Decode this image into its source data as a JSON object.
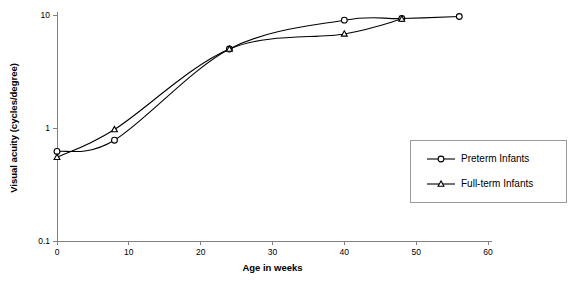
{
  "chart_data": {
    "type": "line",
    "title": "",
    "xlabel": "Age in weeks",
    "ylabel": "Visual acuity (cycles/degree)",
    "xlim": [
      0,
      60
    ],
    "ylim": [
      0.1,
      10
    ],
    "yscale": "log",
    "grid": false,
    "legend_position": "right-middle",
    "x_ticks": [
      "0",
      "10",
      "20",
      "30",
      "40",
      "50",
      "60"
    ],
    "x_tick_values": [
      0,
      10,
      20,
      30,
      40,
      50,
      60
    ],
    "y_ticks": [
      "0.1",
      "1",
      "10"
    ],
    "y_tick_values": [
      0.1,
      1,
      10
    ],
    "series": [
      {
        "name": "Preterm Infants",
        "marker": "circle",
        "color": "#000000",
        "x": [
          0,
          8,
          24,
          40,
          48,
          56
        ],
        "values": [
          0.62,
          0.78,
          5.0,
          9.0,
          9.3,
          9.7
        ]
      },
      {
        "name": "Full-term Infants",
        "marker": "triangle",
        "color": "#000000",
        "x": [
          0,
          8,
          24,
          40,
          48
        ],
        "values": [
          0.55,
          0.97,
          5.0,
          6.8,
          9.2
        ]
      }
    ]
  },
  "legend": {
    "entries": [
      {
        "label": "Preterm Infants",
        "marker": "circle"
      },
      {
        "label": "Full-term Infants",
        "marker": "triangle"
      }
    ]
  },
  "colors": {
    "axis": "#808080",
    "line": "#000000",
    "legend_border": "#9a9a9a",
    "background": "#ffffff"
  }
}
